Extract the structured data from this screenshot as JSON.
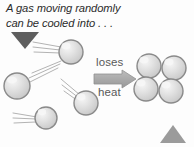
{
  "slide": {
    "width": 194,
    "height": 147,
    "background": "#fdfdfd",
    "caption": "A gas moving randomly\ncan be cooled into . . ."
  },
  "labels": {
    "loses": "loses",
    "heat": "heat"
  },
  "colors": {
    "caption_text": "#2b2b2b",
    "label_text": "#595959",
    "arrow_fill": "#a8a8a8",
    "arrow_stroke": "#8f8f8f",
    "sphere_fill_light": "#e6e6e6",
    "sphere_fill_mid": "#c9c9c9",
    "sphere_ring": "#8a8a8a",
    "sphere_highlight": "#f4f4f4",
    "trail_line": "#b3b3b3",
    "triangle_dark": "#5e5e5e",
    "triangle_light": "#9b9b9b"
  },
  "diagram": {
    "type": "gas-to-solid-cooling",
    "gas_particles": [
      {
        "name": "gas-sphere-1",
        "cx": 71,
        "cy": 52,
        "r": 12
      },
      {
        "name": "gas-sphere-2",
        "cx": 17,
        "cy": 86,
        "r": 13
      },
      {
        "name": "gas-sphere-3",
        "cx": 86,
        "cy": 103,
        "r": 12
      },
      {
        "name": "gas-sphere-4",
        "cx": 46,
        "cy": 118,
        "r": 11
      }
    ],
    "motion_trails": [
      {
        "name": "trail-1",
        "x1": 33,
        "y1": 42,
        "x2": 61,
        "y2": 47
      },
      {
        "name": "trail-2",
        "x1": 33,
        "y1": 47,
        "x2": 60,
        "y2": 50
      },
      {
        "name": "trail-3",
        "x1": 34,
        "y1": 52,
        "x2": 60,
        "y2": 52
      },
      {
        "name": "trail-4",
        "x1": 32,
        "y1": 73,
        "x2": 61,
        "y2": 61
      },
      {
        "name": "trail-5",
        "x1": 29,
        "y1": 78,
        "x2": 60,
        "y2": 63
      },
      {
        "name": "trail-6",
        "x1": 28,
        "y1": 83,
        "x2": 58,
        "y2": 68
      },
      {
        "name": "trail-7",
        "x1": 61,
        "y1": 79,
        "x2": 80,
        "y2": 95
      },
      {
        "name": "trail-8",
        "x1": 62,
        "y1": 85,
        "x2": 79,
        "y2": 98
      },
      {
        "name": "trail-9",
        "x1": 63,
        "y1": 91,
        "x2": 78,
        "y2": 101
      },
      {
        "name": "trail-10",
        "x1": 13,
        "y1": 113,
        "x2": 37,
        "y2": 117
      },
      {
        "name": "trail-11",
        "x1": 13,
        "y1": 118,
        "x2": 36,
        "y2": 119
      },
      {
        "name": "trail-12",
        "x1": 14,
        "y1": 123,
        "x2": 36,
        "y2": 122
      }
    ],
    "solid_particles": [
      {
        "name": "solid-sphere-1",
        "cx": 149,
        "cy": 66,
        "r": 12
      },
      {
        "name": "solid-sphere-2",
        "cx": 174,
        "cy": 68,
        "r": 12
      },
      {
        "name": "solid-sphere-3",
        "cx": 146,
        "cy": 89,
        "r": 12
      },
      {
        "name": "solid-sphere-4",
        "cx": 171,
        "cy": 91,
        "r": 12
      }
    ],
    "arrow": {
      "name": "loses-heat-arrow",
      "direction": "right",
      "x": 94,
      "y": 71,
      "width": 42,
      "height": 16
    },
    "triangles": [
      {
        "name": "triangle-top-left",
        "direction": "down",
        "points": "11,32 39,32 25,49",
        "fill": "#5e5e5e"
      },
      {
        "name": "triangle-bottom-right",
        "direction": "up",
        "points": "160,143 186,143 173,125",
        "fill": "#9b9b9b"
      }
    ]
  }
}
